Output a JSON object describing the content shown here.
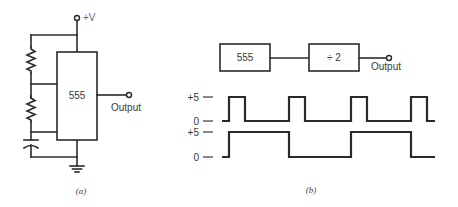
{
  "figure_a": {
    "caption": "(a)",
    "supply_label": "+V",
    "ic_label": "555",
    "output_label": "Output",
    "components": [
      "resistor-r1",
      "resistor-r2",
      "capacitor",
      "ground"
    ]
  },
  "figure_b": {
    "caption": "(b)",
    "block_1_label": "555",
    "block_2_label": "÷ 2",
    "output_label": "Output",
    "waveform_top": {
      "high_label": "+5",
      "low_label": "0",
      "description": "555 output: narrow pulses",
      "rises_x": [
        229,
        289,
        351,
        411
      ],
      "pulse_width": 16
    },
    "waveform_bottom": {
      "high_label": "+5",
      "low_label": "0",
      "description": "÷2 output: square wave at half frequency",
      "transitions_x": [
        229,
        289,
        351,
        411
      ]
    }
  },
  "colors": {
    "line": "#2a2a2a",
    "text": "#3a3a3a",
    "background": "#ffffff"
  }
}
